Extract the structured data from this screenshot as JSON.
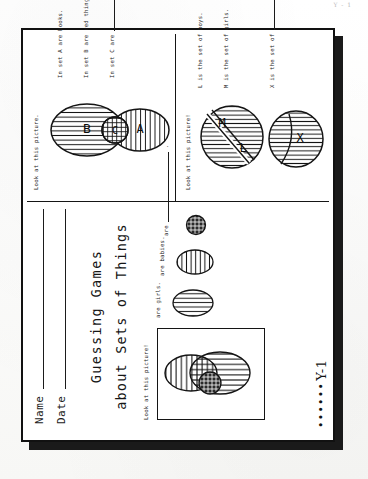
{
  "document": {
    "title_line1": "Guessing Games",
    "title_line2": "about Sets of Things",
    "page_marker_dots": "••••••",
    "page_number": "Y-1",
    "top_edge_ghost_text": "Y - 1"
  },
  "fields": [
    {
      "label": "Name",
      "value": ""
    },
    {
      "label": "Date",
      "value": ""
    }
  ],
  "panels": [
    {
      "id": "panel-sets-picture",
      "prompt": "Look at this picture!",
      "set_labels": [
        "",
        ""
      ],
      "statements": [
        {
          "text": "are girls."
        },
        {
          "text": "are babies."
        },
        {
          "text": "are"
        }
      ]
    },
    {
      "id": "panel-abc",
      "prompt": "Look at this picture.",
      "set_labels": [
        "A",
        "B",
        "C"
      ],
      "statements": [
        {
          "text": "In set A are books."
        },
        {
          "text": "In set B are red things."
        },
        {
          "text": "In set C are"
        }
      ]
    },
    {
      "id": "panel-lmx",
      "prompt": "Look at this picture!",
      "set_labels": [
        "L",
        "M",
        "X"
      ],
      "statements": [
        {
          "text": "L  is the set of boys."
        },
        {
          "text": "M  is the set of girls."
        },
        {
          "text": "X  is the set of"
        }
      ]
    }
  ],
  "colors": {
    "ink": "#111111",
    "paper": "#ffffff",
    "shadow": "#1a1a1a"
  }
}
